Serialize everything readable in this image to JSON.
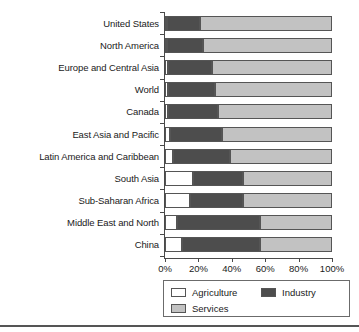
{
  "chart_data": {
    "type": "bar",
    "orientation": "horizontal",
    "stacked": true,
    "stack_mode": "percent",
    "title": "",
    "subtitle": "",
    "xlabel": "",
    "ylabel": "",
    "xlim": [
      0,
      100
    ],
    "xticks": [
      0,
      20,
      40,
      60,
      80,
      100
    ],
    "xtick_labels": [
      "0%",
      "20%",
      "40%",
      "60%",
      "80%",
      "100%"
    ],
    "grid": false,
    "legend_position": "bottom",
    "categories": [
      "United States",
      "North America",
      "Europe and Central Asia",
      "World",
      "Canada",
      "East Asia and Pacific",
      "Latin America and Caribbean",
      "South Asia",
      "Sub-Saharan Africa",
      "Middle East and North",
      "China"
    ],
    "series": [
      {
        "name": "Agriculture",
        "color": "#ffffff",
        "values": [
          1,
          1,
          2,
          2,
          2,
          3,
          5,
          17,
          15,
          7,
          10
        ]
      },
      {
        "name": "Industry",
        "color": "#4d4d4d",
        "values": [
          20,
          22,
          26,
          28,
          30,
          31,
          34,
          30,
          32,
          50,
          47
        ]
      },
      {
        "name": "Services",
        "color": "#c2c2c2",
        "values": [
          79,
          77,
          72,
          70,
          68,
          66,
          61,
          53,
          53,
          43,
          43
        ]
      }
    ],
    "legend": [
      {
        "label": "Agriculture",
        "color": "#ffffff"
      },
      {
        "label": "Industry",
        "color": "#4d4d4d"
      },
      {
        "label": "Services",
        "color": "#c2c2c2"
      }
    ]
  }
}
